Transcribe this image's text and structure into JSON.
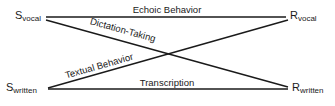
{
  "nodes": {
    "s_vocal": {
      "main": "S",
      "sub": "vocal"
    },
    "r_vocal": {
      "main": "R",
      "sub": "vocal"
    },
    "s_written": {
      "main": "S",
      "sub": "written"
    },
    "r_written": {
      "main": "R",
      "sub": "written"
    }
  },
  "edges": {
    "echoic": "Echoic Behavior",
    "dictation": "Dictation-Taking",
    "textual": "Textual Behavior",
    "transcription": "Transcription"
  },
  "colors": {
    "ink": "#1a1a1a",
    "background": "#ffffff"
  }
}
